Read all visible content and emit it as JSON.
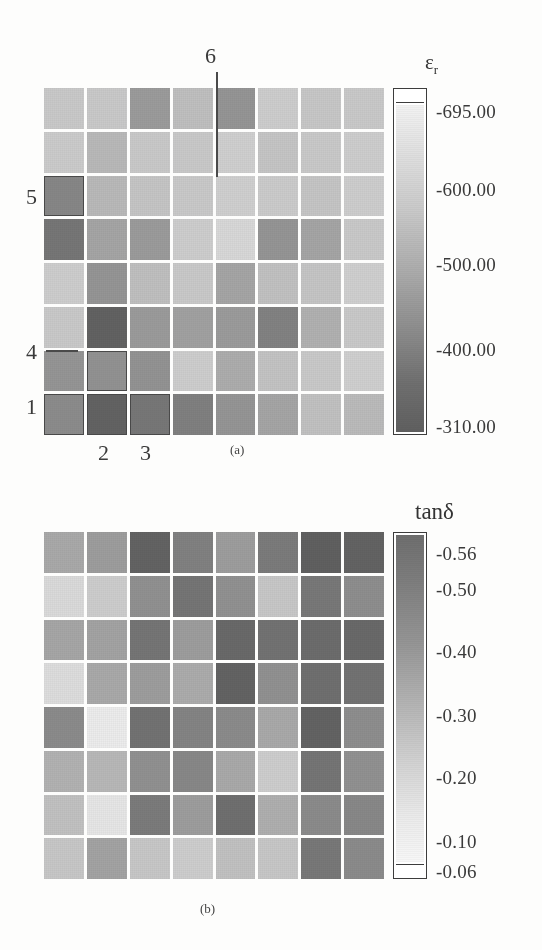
{
  "figure": {
    "panel_a_caption": "(a)",
    "panel_b_caption": "(b)"
  },
  "panel_a": {
    "colorbar_title": "ε",
    "colorbar_title_sub": "r",
    "ticks": [
      "-695.00",
      "-600.00",
      "-500.00",
      "-400.00",
      "-310.00"
    ],
    "annotations": [
      {
        "label": "6"
      },
      {
        "label": "5"
      },
      {
        "label": "4"
      },
      {
        "label": "1"
      },
      {
        "label": "2"
      },
      {
        "label": "3"
      }
    ]
  },
  "panel_b": {
    "colorbar_title": "tanδ",
    "ticks": [
      "-0.56",
      "-0.50",
      "-0.40",
      "-0.30",
      "-0.20",
      "-0.10",
      "-0.06"
    ]
  },
  "chart_data": [
    {
      "type": "heatmap",
      "title": "εr",
      "panel": "(a)",
      "rows": 8,
      "cols": 8,
      "vmin": 310.0,
      "vmax": 695.0,
      "colormap": "grayscale: light = high (695), dark = low (310)",
      "colorbar_ticks": [
        695.0,
        600.0,
        500.0,
        400.0,
        310.0
      ],
      "xlabel": "",
      "ylabel": "",
      "grid": true,
      "legend_position": "right",
      "values": [
        [
          430,
          430,
          545,
          455,
          560,
          420,
          435,
          430
        ],
        [
          425,
          470,
          430,
          430,
          415,
          440,
          430,
          420
        ],
        [
          600,
          470,
          440,
          430,
          415,
          425,
          440,
          420
        ],
        [
          640,
          520,
          545,
          420,
          390,
          560,
          520,
          430
        ],
        [
          420,
          560,
          455,
          430,
          520,
          450,
          440,
          415
        ],
        [
          430,
          690,
          545,
          530,
          545,
          610,
          490,
          430
        ],
        [
          560,
          570,
          565,
          420,
          500,
          445,
          430,
          415
        ],
        [
          585,
          690,
          640,
          615,
          560,
          520,
          450,
          465
        ]
      ],
      "highlighted_cells": [
        {
          "label": "5",
          "row": 3,
          "col": 1
        },
        {
          "label": "4",
          "row": 7,
          "col": 2
        },
        {
          "label": "1",
          "row": 8,
          "col": 1
        },
        {
          "label": "2",
          "row": 8,
          "col": 2
        },
        {
          "label": "3",
          "row": 8,
          "col": 3
        },
        {
          "label": "6",
          "row": 1,
          "col": 5
        }
      ]
    },
    {
      "type": "heatmap",
      "title": "tanδ",
      "panel": "(b)",
      "rows": 8,
      "cols": 8,
      "vmin": 0.06,
      "vmax": 0.56,
      "colormap": "grayscale: dark = high (0.56), light = low (0.06)",
      "colorbar_ticks": [
        0.56,
        0.5,
        0.4,
        0.3,
        0.2,
        0.1,
        0.06
      ],
      "xlabel": "",
      "ylabel": "",
      "grid": true,
      "legend_position": "right",
      "values": [
        [
          0.3,
          0.26,
          0.07,
          0.17,
          0.26,
          0.15,
          0.06,
          0.07
        ],
        [
          0.46,
          0.42,
          0.22,
          0.13,
          0.22,
          0.4,
          0.14,
          0.21
        ],
        [
          0.29,
          0.28,
          0.13,
          0.26,
          0.09,
          0.12,
          0.1,
          0.09
        ],
        [
          0.47,
          0.3,
          0.26,
          0.31,
          0.07,
          0.22,
          0.11,
          0.12
        ],
        [
          0.2,
          0.52,
          0.12,
          0.18,
          0.2,
          0.3,
          0.07,
          0.21
        ],
        [
          0.33,
          0.35,
          0.22,
          0.19,
          0.3,
          0.42,
          0.13,
          0.22
        ],
        [
          0.38,
          0.5,
          0.15,
          0.26,
          0.11,
          0.32,
          0.2,
          0.19
        ],
        [
          0.4,
          0.28,
          0.4,
          0.42,
          0.38,
          0.4,
          0.14,
          0.2
        ]
      ]
    }
  ]
}
